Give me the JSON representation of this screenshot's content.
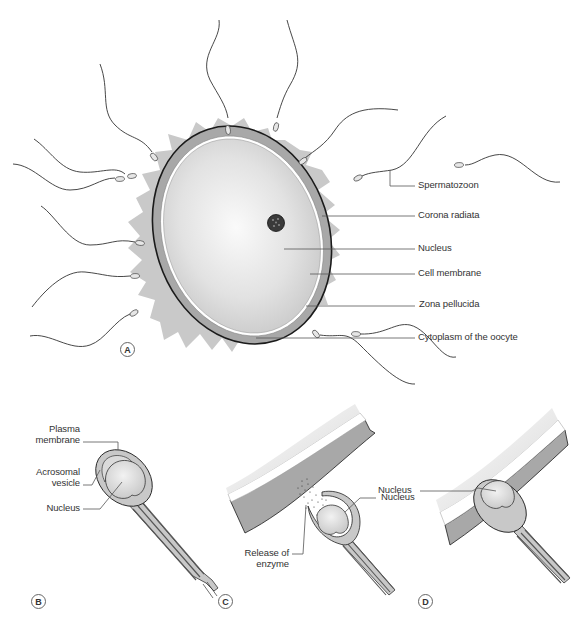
{
  "figure": {
    "panels": [
      {
        "id": "A",
        "tag": "A",
        "description": "Oocyte surrounded by spermatozoa"
      },
      {
        "id": "B",
        "tag": "B",
        "description": "Sperm head structure"
      },
      {
        "id": "C",
        "tag": "C",
        "description": "Acrosome reaction at zona pellucida"
      },
      {
        "id": "D",
        "tag": "D",
        "description": "Sperm penetrating cell membrane"
      }
    ],
    "panel_a_labels": {
      "spermatozoon": "Spermatozoon",
      "corona_radiata": "Corona radiata",
      "nucleus": "Nucleus",
      "cell_membrane": "Cell membrane",
      "zona_pellucida": "Zona pellucida",
      "cytoplasm": "Cytoplasm of the oocyte"
    },
    "panel_b_labels": {
      "plasma_membrane_1": "Plasma",
      "plasma_membrane_2": "membrane",
      "acrosomal_vesicle_1": "Acrosomal",
      "acrosomal_vesicle_2": "vesicle",
      "nucleus": "Nucleus"
    },
    "panel_c_labels": {
      "nucleus": "Nucleus",
      "release_1": "Release of",
      "release_2": "enzyme"
    },
    "panel_d_labels": {
      "nucleus": "Nucleus"
    },
    "colors": {
      "corona": "#c8c8c8",
      "zona": "#a9a9a9",
      "membrane_gap": "#ffffff",
      "cytoplasm_center": "#f7f7f7",
      "cytoplasm_edge": "#cfcfcf",
      "outline": "#1a1a1a",
      "nucleus": "#3a3a3a",
      "sperm_head": "#d4d4d4",
      "leader_line": "#555555"
    }
  }
}
